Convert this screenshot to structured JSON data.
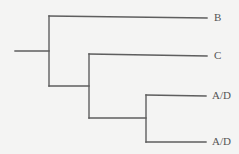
{
  "diagram": {
    "type": "cladogram",
    "line_color": "#5e5e5e",
    "label_color": "#555555",
    "background": "#f4f4f3",
    "leaves": [
      {
        "id": "leaf-b",
        "label": "B",
        "x": 214,
        "y": 18
      },
      {
        "id": "leaf-c",
        "label": "C",
        "x": 214,
        "y": 56
      },
      {
        "id": "leaf-ad-1",
        "label": "A/D",
        "x": 212,
        "y": 96
      },
      {
        "id": "leaf-ad-2",
        "label": "A/D",
        "x": 212,
        "y": 142
      }
    ],
    "structure": "(B,(C,(A/D,A/D)))"
  }
}
